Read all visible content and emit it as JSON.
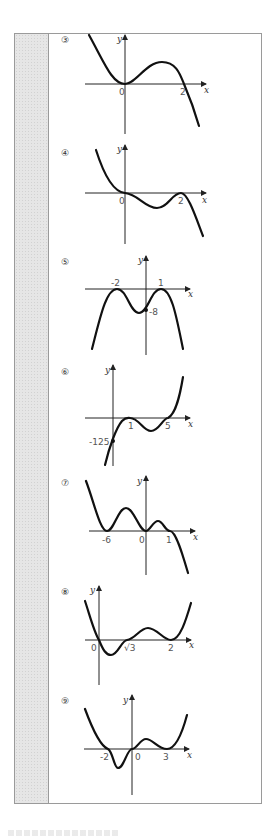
{
  "page": {
    "gutter_color": "#e6e6e6",
    "border_color": "#9a9a9a"
  },
  "graphs": [
    {
      "number": "③",
      "axis_x": "x",
      "axis_y": "y",
      "labels": [
        "0",
        "2"
      ],
      "description": "cubic: double root at 0, root at 2, falls to right"
    },
    {
      "number": "④",
      "axis_x": "x",
      "axis_y": "y",
      "labels": [
        "0",
        "2"
      ],
      "description": "quartic-like: inflection at 0, touches at 2, falls to right"
    },
    {
      "number": "⑤",
      "axis_x": "x",
      "axis_y": "y",
      "labels": [
        "-2",
        "1",
        "-8"
      ],
      "description": "quartic opening down, double roots at -2 and 1, y-intercept -8"
    },
    {
      "number": "⑥",
      "axis_x": "x",
      "axis_y": "y",
      "labels": [
        "1",
        "-125",
        "5"
      ],
      "description": "cubic: double root at 1, root at 5, y-intercept -125"
    },
    {
      "number": "⑦",
      "axis_x": "x",
      "axis_y": "y",
      "labels": [
        "-6",
        "0",
        "1"
      ],
      "description": "double roots at -6 and 0, triple root at 1, falls to right"
    },
    {
      "number": "⑧",
      "axis_x": "x",
      "axis_y": "y",
      "labels": [
        "0",
        "√3",
        "2"
      ],
      "description": "roots at 0 and √3, double root at 2, rises both ends"
    },
    {
      "number": "⑨",
      "axis_x": "x",
      "axis_y": "y",
      "labels": [
        "-2",
        "0",
        "3"
      ],
      "description": "roots at -2 and 0, double root at 3, rises both ends"
    }
  ]
}
